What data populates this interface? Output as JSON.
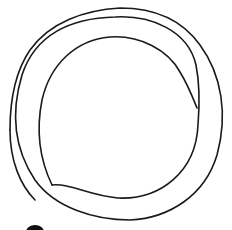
{
  "drawing": {
    "description": "Hand-drawn loop line art",
    "stroke_color": "#1a1a1a",
    "background": "#ffffff"
  }
}
